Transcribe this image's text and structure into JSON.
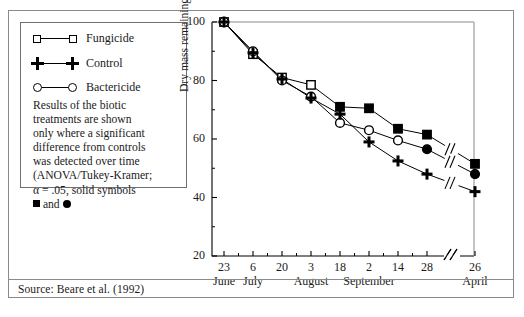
{
  "figure": {
    "source_note": "Source: Beare et al. (1992)"
  },
  "legend": {
    "entries": [
      {
        "label": "Fungicide",
        "symbol": "open-square"
      },
      {
        "label": "Control",
        "symbol": "plus"
      },
      {
        "label": "Bactericide",
        "symbol": "open-circle"
      }
    ],
    "note_lines": [
      "Results of the biotic",
      "treatments are shown",
      "only where a significant",
      "difference from controls",
      "was detected over time",
      "(ANOVA/Tukey-Kramer;",
      "α = .05, solid symbols"
    ],
    "note_last_prefix": "",
    "note_last_middle": " and ",
    "note_last_suffix": ""
  },
  "chart_data": {
    "type": "line",
    "title": "",
    "xlabel": "",
    "ylabel": "Dry mass remaining (%)",
    "ylim": [
      20,
      100
    ],
    "yticks": [
      20,
      40,
      60,
      80,
      100
    ],
    "ytick_labels": [
      "20",
      "40",
      "60",
      "80",
      "100"
    ],
    "grid": false,
    "legend_position": "outside-left",
    "axis_break": true,
    "axis_break_note": "break between 28 September and 26 April",
    "x": [
      "23",
      "6",
      "20",
      "3",
      "18",
      "2",
      "14",
      "28",
      "26"
    ],
    "xtick_labels": [
      "23",
      "6",
      "20",
      "3",
      "18",
      "2",
      "14",
      "28",
      "26"
    ],
    "xmonths": [
      {
        "label": "June",
        "tick_index": 0
      },
      {
        "label": "July",
        "tick_index": 1
      },
      {
        "label": "August",
        "tick_index": 3
      },
      {
        "label": "September",
        "tick_index": 5
      },
      {
        "label": "April",
        "tick_index": 8
      }
    ],
    "series": [
      {
        "name": "Fungicide",
        "marker": "square",
        "values": [
          100,
          89,
          81,
          78.5,
          71,
          70.5,
          63.5,
          61.5,
          51.5
        ],
        "solid_from_index": 4
      },
      {
        "name": "Bactericide",
        "marker": "circle",
        "values": [
          100,
          90,
          80,
          74.5,
          65.5,
          63,
          59.5,
          56.5,
          48
        ],
        "solid_from_index": 7
      },
      {
        "name": "Control",
        "marker": "plus",
        "values": [
          100,
          89.5,
          80.5,
          74,
          68.5,
          59,
          52.5,
          48,
          42
        ],
        "solid_from_index": null
      }
    ]
  }
}
